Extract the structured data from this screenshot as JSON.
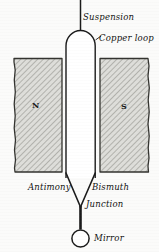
{
  "figure": {
    "background_color": "#fbfbfa",
    "ink_color": "#1a1a1a",
    "hatch_color": "#9a9a95",
    "pole_fill_color": "#d8d8d4",
    "width": 159,
    "height": 252
  },
  "labels": {
    "suspension": "Suspension",
    "copper_loop": "Copper loop",
    "antimony": "Antimony",
    "bismuth": "Bismuth",
    "junction": "Junction",
    "mirror": "Mirror"
  },
  "poles": {
    "north": "N",
    "south": "S"
  }
}
